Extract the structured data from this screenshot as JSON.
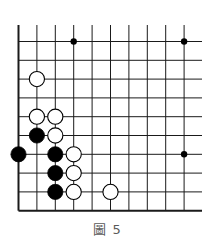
{
  "figure": {
    "caption": "圖 5",
    "type": "go-board-diagram",
    "visible_columns": 11,
    "visible_rows": 10,
    "edges": {
      "left": true,
      "bottom": true,
      "top": false,
      "right": false
    },
    "colors": {
      "line": "#1a1a1a",
      "black_stone": "#000000",
      "white_stone": "#ffffff",
      "caption": "#5a5a5a"
    }
  },
  "board": {
    "origin_x": 18.5,
    "origin_y": 41.5,
    "col_spacing": 18.4,
    "row_spacing": 18.8,
    "cols": 11,
    "rows": 10,
    "line_top_extend": 25,
    "line_right_extend": 202,
    "star_points": [
      {
        "col": 3,
        "row": 0
      },
      {
        "col": 9,
        "row": 0
      },
      {
        "col": 9,
        "row": 6
      }
    ],
    "stones": [
      {
        "color": "white",
        "col": 1,
        "row": 2
      },
      {
        "color": "white",
        "col": 1,
        "row": 4
      },
      {
        "color": "white",
        "col": 2,
        "row": 4
      },
      {
        "color": "black",
        "col": 1,
        "row": 5
      },
      {
        "color": "white",
        "col": 2,
        "row": 5
      },
      {
        "color": "black",
        "col": 0,
        "row": 6
      },
      {
        "color": "black",
        "col": 2,
        "row": 6
      },
      {
        "color": "white",
        "col": 3,
        "row": 6
      },
      {
        "color": "black",
        "col": 2,
        "row": 7
      },
      {
        "color": "white",
        "col": 3,
        "row": 7
      },
      {
        "color": "black",
        "col": 2,
        "row": 8
      },
      {
        "color": "white",
        "col": 3,
        "row": 8
      },
      {
        "color": "white",
        "col": 5,
        "row": 8
      }
    ]
  }
}
